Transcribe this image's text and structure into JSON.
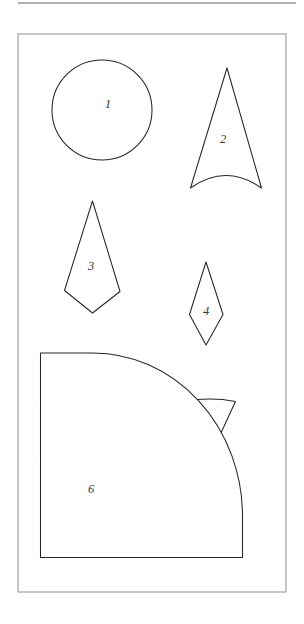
{
  "document": {
    "title": "Geometric Shapes Worksheet",
    "background_color": "#ffffff",
    "frame_color": "#9a9a9a",
    "outline_color": "#262626",
    "label_color": "#3a3a3a",
    "canvas": {
      "width": 304,
      "height": 624
    },
    "top_rule": {
      "x1": 18,
      "y1": 3,
      "x2": 296,
      "y2": 3
    },
    "frame": {
      "x": 18,
      "y": 34,
      "width": 268,
      "height": 558
    }
  },
  "shapes": [
    {
      "label": "1",
      "name": "circle",
      "kind": "circle",
      "cx": 102,
      "cy": 110,
      "r": 50,
      "label_x": 108,
      "label_y": 105
    },
    {
      "label": "2",
      "name": "concave-base-triangle",
      "kind": "path",
      "d": "M 227 68 L 261.5 188 Q 226 163 190.5 188 Z",
      "label_x": 223,
      "label_y": 140
    },
    {
      "label": "3",
      "name": "kite-large",
      "kind": "path",
      "d": "M 92.5 201 L 120 291.5 L 92.5 313 L 64.5 290.5 Z",
      "label_x": 91,
      "label_y": 267
    },
    {
      "label": "4",
      "name": "kite-small",
      "kind": "path",
      "d": "M 206 262 L 223 314.5 L 206 345 L 189.5 314.5 Z",
      "label_x": 206,
      "label_y": 312
    },
    {
      "label": "5",
      "name": "inverted-sector-triangle",
      "kind": "path",
      "d": "M 177 403 Q 206.5 396 235.5 401.5 L 207 463 Z",
      "label_x": 207,
      "label_y": 422
    },
    {
      "label": "6",
      "name": "l-shape-with-fillet",
      "kind": "path",
      "d": "M 40.5 353 L 93 353 A 150 163 0 0 1 242.5 516 L 242.5 557.5 L 40.5 557.5 Z",
      "label_x": 91,
      "label_y": 490
    }
  ]
}
